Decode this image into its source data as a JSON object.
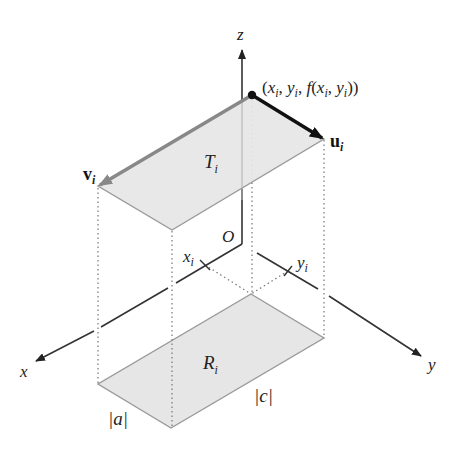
{
  "figure": {
    "colors": {
      "fill": "#e6e6e6",
      "edge": "#9a9a9a",
      "axis": "#333333",
      "u_vector": "#111111",
      "v_vector": "#888888",
      "background": "#ffffff"
    },
    "axes": {
      "x_label": "x",
      "y_label": "y",
      "z_label": "z",
      "origin_label": "O"
    },
    "ticks": {
      "x_tick": "x",
      "x_tick_sub": "i",
      "y_tick": "y",
      "y_tick_sub": "i"
    },
    "point_label": {
      "open": "(",
      "x": "x",
      "x_sub": "i",
      "sep1": ", ",
      "y": "y",
      "y_sub": "i",
      "sep2": ", ",
      "f": "f",
      "open2": "(",
      "x2": "x",
      "x2_sub": "i",
      "sep3": ", ",
      "y2": "y",
      "y2_sub": "i",
      "close": "))"
    },
    "vectors": {
      "u": "u",
      "u_sub": "i",
      "v": "v",
      "v_sub": "i"
    },
    "regions": {
      "T": "T",
      "T_sub": "i",
      "R": "R",
      "R_sub": "i"
    },
    "lengths": {
      "a": "|a|",
      "c": "|c|"
    }
  }
}
